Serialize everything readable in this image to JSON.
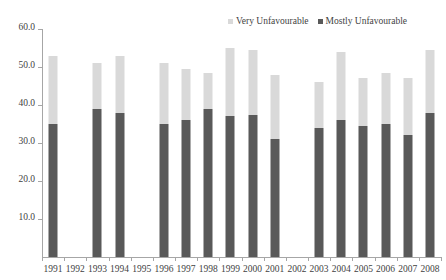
{
  "chart_data": {
    "type": "bar",
    "subtype": "stacked-column",
    "title": "",
    "subtitle": "",
    "xlabel": "",
    "ylabel": "",
    "ylim": [
      0,
      60
    ],
    "ytick_step": 10,
    "grid": false,
    "legend_position": "top-right",
    "categories": [
      "1991",
      "1992",
      "1993",
      "1994",
      "1995",
      "1996",
      "1997",
      "1998",
      "1999",
      "2000",
      "2001",
      "2002",
      "2003",
      "2004",
      "2005",
      "2006",
      "2007",
      "2008"
    ],
    "ytick_labels": [
      "10.0",
      "20.0",
      "30.0",
      "40.0",
      "50.0",
      "60.0"
    ],
    "ytick_values": [
      10,
      20,
      30,
      40,
      50,
      60
    ],
    "series": [
      {
        "name": "Mostly Unfavourable",
        "color": "#595959",
        "values": [
          35,
          null,
          39,
          38,
          null,
          35,
          36,
          39,
          37,
          37.5,
          31,
          null,
          34,
          36,
          34.5,
          35,
          32,
          38
        ]
      },
      {
        "name": "Very Unfavourable",
        "color": "#d9d9d9",
        "values": [
          18,
          null,
          12,
          15,
          null,
          16,
          13.5,
          9.5,
          18,
          17,
          17,
          null,
          12,
          18,
          12.5,
          13.5,
          15,
          16.5
        ]
      }
    ],
    "totals": [
      53,
      null,
      51,
      53,
      null,
      51,
      49.5,
      48.5,
      55,
      54.5,
      48,
      null,
      46,
      54,
      47,
      48.5,
      47,
      54.5
    ],
    "missing_categories": [
      "1992",
      "1995",
      "2002"
    ],
    "annotations": []
  },
  "legend": {
    "entries": [
      {
        "label": "Very Unfavourable",
        "color": "#d9d9d9"
      },
      {
        "label": "Mostly Unfavourable",
        "color": "#595959"
      }
    ]
  },
  "colors": {
    "very_unfavourable": "#d9d9d9",
    "mostly_unfavourable": "#595959",
    "axis": "#a6a6a6",
    "text": "#3f3f3f",
    "background": "#ffffff"
  }
}
